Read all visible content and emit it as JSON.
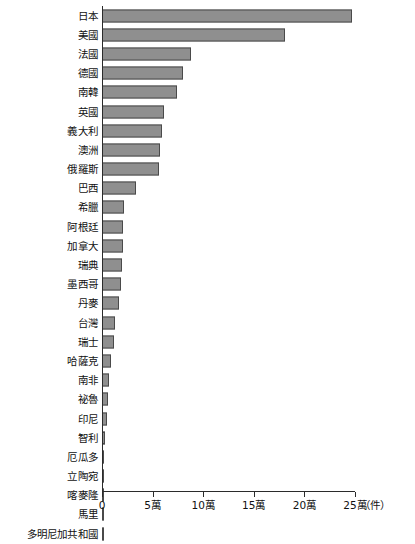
{
  "chart_data": {
    "type": "bar",
    "orientation": "horizontal",
    "title": "",
    "subtitle": "",
    "xlabel": "（件）",
    "ylabel": "",
    "xlim": [
      0,
      250000
    ],
    "grid": false,
    "legend": null,
    "unit_label": "（件）",
    "unit_suffix": "萬",
    "tick_labels": [
      "0",
      "5萬",
      "10萬",
      "15萬",
      "20萬",
      "25萬"
    ],
    "tick_values": [
      0,
      50000,
      100000,
      150000,
      200000,
      250000
    ],
    "bar_color": "#8f8f8f",
    "bar_border_color": "#4a4a4a",
    "axis_color": "#2b2b2b",
    "categories": [
      "日本",
      "美國",
      "法國",
      "德國",
      "南韓",
      "英國",
      "義大利",
      "澳洲",
      "俄羅斯",
      "巴西",
      "希臘",
      "阿根廷",
      "加拿大",
      "瑞典",
      "墨西哥",
      "丹麥",
      "台灣",
      "瑞士",
      "哈薩克",
      "南非",
      "祕魯",
      "印尼",
      "智利",
      "厄瓜多",
      "立陶宛",
      "喀麥隆",
      "馬里",
      "多明尼加共和國"
    ],
    "values": [
      247000,
      181000,
      88000,
      80000,
      74000,
      61000,
      59000,
      57000,
      56000,
      34000,
      22000,
      21000,
      21000,
      20000,
      19000,
      17000,
      13000,
      12000,
      9000,
      7000,
      6000,
      5000,
      3000,
      2000,
      2000,
      1500,
      1500,
      1200
    ]
  },
  "chart": {
    "series_name": "件數"
  }
}
